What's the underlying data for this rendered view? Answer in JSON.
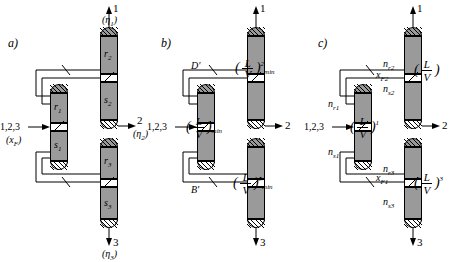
{
  "figure": {
    "panels": [
      {
        "key": "a",
        "label": "a)",
        "feed_label": "1,2,3",
        "feed_sub": "(x_F)",
        "sections": [
          {
            "name": "r2",
            "text": "r"
          },
          {
            "name": "s2",
            "text": "s"
          },
          {
            "name": "r1",
            "text": "r"
          },
          {
            "name": "s1",
            "text": "s"
          },
          {
            "name": "r3",
            "text": "r"
          },
          {
            "name": "s3",
            "text": "s"
          }
        ],
        "section_labels": [
          {
            "base": "r",
            "sub": "2"
          },
          {
            "base": "s",
            "sub": "2"
          },
          {
            "base": "r",
            "sub": "1"
          },
          {
            "base": "s",
            "sub": "1"
          },
          {
            "base": "r",
            "sub": "3"
          },
          {
            "base": "s",
            "sub": "3"
          }
        ],
        "products": [
          {
            "num": "1",
            "paren": "(",
            "base": "η",
            "sub": "1",
            "close": ")"
          },
          {
            "num": "2",
            "paren": "(",
            "base": "η",
            "sub": "2",
            "close": ")"
          },
          {
            "num": "3",
            "paren": "(",
            "base": "η",
            "sub": "3",
            "close": ")"
          }
        ]
      },
      {
        "key": "b",
        "label": "b)",
        "feed_label": "1,2,3",
        "internal_top": "D'",
        "internal_bottom": "B'",
        "products": [
          "1",
          "2",
          "3"
        ],
        "fractions": [
          {
            "num": "L",
            "den": "V",
            "exp": "2",
            "sub": "min"
          },
          {
            "num": "L",
            "den": "V",
            "exp": "1",
            "sub": "min"
          },
          {
            "num": "L",
            "den": "V",
            "exp": "3",
            "sub": "min"
          }
        ]
      },
      {
        "key": "c",
        "label": "c)",
        "feed_label": "1,2,3",
        "products": [
          "1",
          "2",
          "3"
        ],
        "stage_labels": [
          {
            "base": "n",
            "sub": "r2"
          },
          {
            "base": "n",
            "sub": "s2"
          },
          {
            "base": "n",
            "sub": "r1"
          },
          {
            "base": "n",
            "sub": "s1"
          },
          {
            "base": "n",
            "sub": "r3"
          },
          {
            "base": "n",
            "sub": "s3"
          }
        ],
        "comp_labels": [
          {
            "base": "x",
            "sub": "F2"
          },
          {
            "base": "x",
            "sub": "F1"
          }
        ],
        "fractions": [
          {
            "num": "L",
            "den": "V",
            "exp": "2"
          },
          {
            "num": "L",
            "den": "V",
            "exp": "1"
          },
          {
            "num": "L",
            "den": "V",
            "exp": "3"
          }
        ]
      }
    ]
  }
}
